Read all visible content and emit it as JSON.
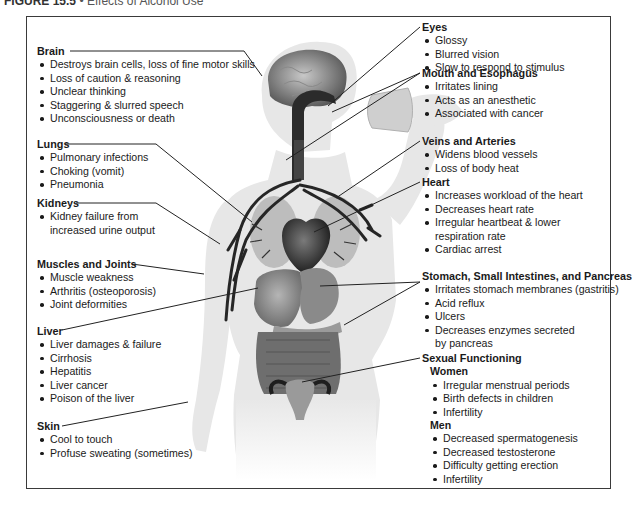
{
  "figure": {
    "label": "FIGURE 15.5",
    "separator": "•",
    "title": "Effects of Alcohol Use"
  },
  "sections": {
    "brain": {
      "heading": "Brain",
      "items": [
        "Destroys brain cells, loss of fine motor skills",
        "Loss of caution & reasoning",
        "Unclear thinking",
        "Staggering & slurred speech",
        "Unconsciousness or death"
      ]
    },
    "lungs": {
      "heading": "Lungs",
      "items": [
        "Pulmonary infections",
        "Choking (vomit)",
        "Pneumonia"
      ]
    },
    "kidneys": {
      "heading": "Kidneys",
      "items": [
        "Kidney failure from increased urine output"
      ]
    },
    "muscles": {
      "heading": "Muscles and Joints",
      "items": [
        "Muscle weakness",
        "Arthritis (osteoporosis)",
        "Joint deformities"
      ]
    },
    "liver": {
      "heading": "Liver",
      "items": [
        "Liver damages & failure",
        "Cirrhosis",
        "Hepatitis",
        "Liver cancer",
        "Poison of the liver"
      ]
    },
    "skin": {
      "heading": "Skin",
      "items": [
        "Cool to touch",
        "Profuse sweating (sometimes)"
      ]
    },
    "eyes": {
      "heading": "Eyes",
      "items": [
        "Glossy",
        "Blurred vision",
        "Slow to respond to stimulus"
      ]
    },
    "mouth": {
      "heading": "Mouth and Esophagus",
      "items": [
        "Irritates lining",
        "Acts as an anesthetic",
        "Associated with cancer"
      ]
    },
    "veins": {
      "heading": "Veins and Arteries",
      "items": [
        "Widens blood vessels",
        "Loss of body heat"
      ]
    },
    "heart": {
      "heading": "Heart",
      "items": [
        "Increases workload of the heart",
        "Decreases heart rate",
        "Irregular heartbeat & lower respiration rate",
        "Cardiac arrest"
      ]
    },
    "stomach": {
      "heading": "Stomach, Small Intestines, and Pancreas",
      "items": [
        "Irritates stomach membranes (gastritis)",
        "Acid reflux",
        "Ulcers",
        "Decreases enzymes secreted by pancreas"
      ]
    },
    "sexual": {
      "heading": "Sexual Functioning",
      "women": {
        "heading": "Women",
        "items": [
          "Irregular menstrual periods",
          "Birth defects in children",
          "Infertility"
        ]
      },
      "men": {
        "heading": "Men",
        "items": [
          "Decreased spermatogenesis",
          "Decreased testosterone",
          "Difficulty getting erection",
          "Infertility"
        ]
      }
    }
  },
  "colors": {
    "frame": "#3a3a3a",
    "body_silhouette": "#e6e6e6",
    "organ_dark": "#2b2b2b",
    "organ_mid": "#8a8a8a",
    "organ_light": "#bdbdbd",
    "leader_line": "#222222"
  }
}
